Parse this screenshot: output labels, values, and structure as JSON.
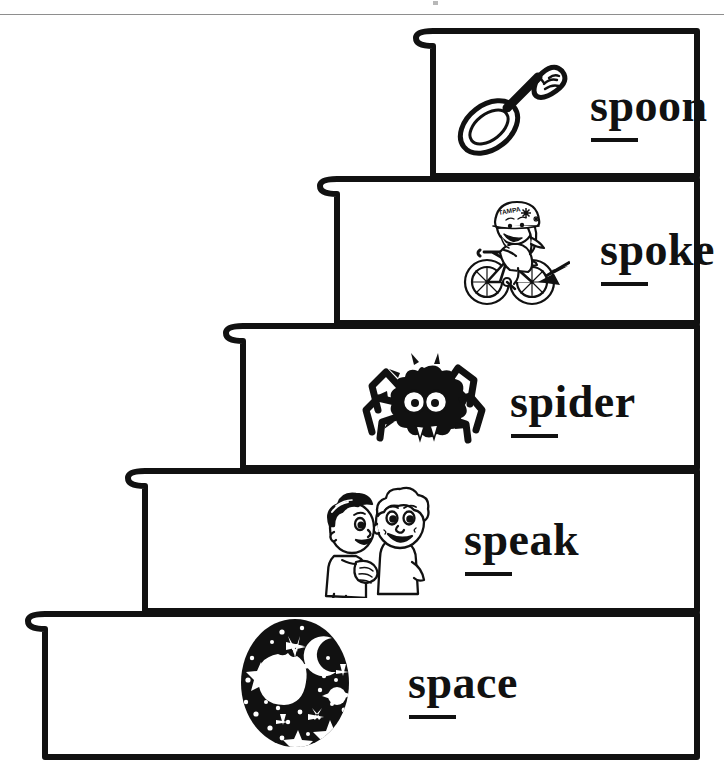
{
  "page": {
    "kind": "worksheet-illustration",
    "theme": "sp-digraph-word-stairs",
    "background_color": "#ffffff",
    "ink_color": "#111111",
    "top_rule_color": "#8e8e8e",
    "width": 724,
    "height": 781
  },
  "staircase": {
    "step_count": 5,
    "direction": "descending-left-to-right",
    "outline_color": "#111111",
    "outline_width": 6,
    "fill_color": "#ffffff",
    "nosing_shape": "rounded-lip"
  },
  "steps": [
    {
      "index": 1,
      "position": "top",
      "word": "spoon",
      "digraph": "sp",
      "underlined_part": "sp",
      "icon": "spoon-icon",
      "icon_description": "tilted spoon with decorated handle",
      "tread_left": 416,
      "tread_top": 28,
      "tread_right": 700,
      "tread_bottom": 176
    },
    {
      "index": 2,
      "position": "second",
      "word": "spoke",
      "digraph": "sp",
      "underlined_part": "sp",
      "icon": "bicycle-spoke-icon",
      "icon_description": "girl riding a bicycle with an arrow pointing at the wheel spokes",
      "icon_text": "TAMPA",
      "tread_left": 320,
      "tread_top": 176,
      "tread_right": 700,
      "tread_bottom": 323
    },
    {
      "index": 3,
      "position": "middle",
      "word": "spider",
      "digraph": "sp",
      "underlined_part": "sp",
      "icon": "spider-icon",
      "icon_description": "black furry spider with large white eyes and fangs",
      "tread_left": 226,
      "tread_top": 323,
      "tread_right": 700,
      "tread_bottom": 468
    },
    {
      "index": 4,
      "position": "fourth",
      "word": "speak",
      "digraph": "sp",
      "underlined_part": "sp",
      "icon": "two-children-speaking-icon",
      "icon_description": "one child whispering to a smiling child",
      "tread_left": 128,
      "tread_top": 468,
      "tread_right": 700,
      "tread_bottom": 611
    },
    {
      "index": 5,
      "position": "bottom",
      "word": "space",
      "digraph": "sp",
      "underlined_part": "sp",
      "icon": "outer-space-icon",
      "icon_description": "black circle of night sky with moon, planet, stars and a comet",
      "tread_left": 28,
      "tread_top": 611,
      "tread_right": 700,
      "tread_bottom": 760
    }
  ]
}
